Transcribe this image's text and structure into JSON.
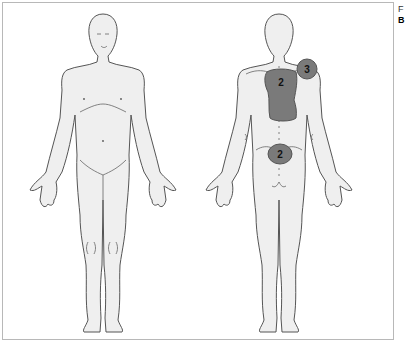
{
  "figure": {
    "side_label_top": "F",
    "side_label_bottom": "B",
    "views": [
      {
        "name": "front-view",
        "label": "anterior"
      },
      {
        "name": "back-view",
        "label": "posterior"
      }
    ],
    "colors": {
      "body_fill": "#efefef",
      "outline": "#555555",
      "pain_region": "#7a7a7a",
      "frame": "#b8b8b8"
    }
  },
  "pain_regions": [
    {
      "id": "upper-back",
      "view": "back",
      "location": "upper back / between shoulder blades",
      "score": "2"
    },
    {
      "id": "right-shoulder",
      "view": "back",
      "location": "shoulder",
      "score": "3"
    },
    {
      "id": "lower-back",
      "view": "back",
      "location": "lower back / lumbar",
      "score": "2"
    }
  ]
}
